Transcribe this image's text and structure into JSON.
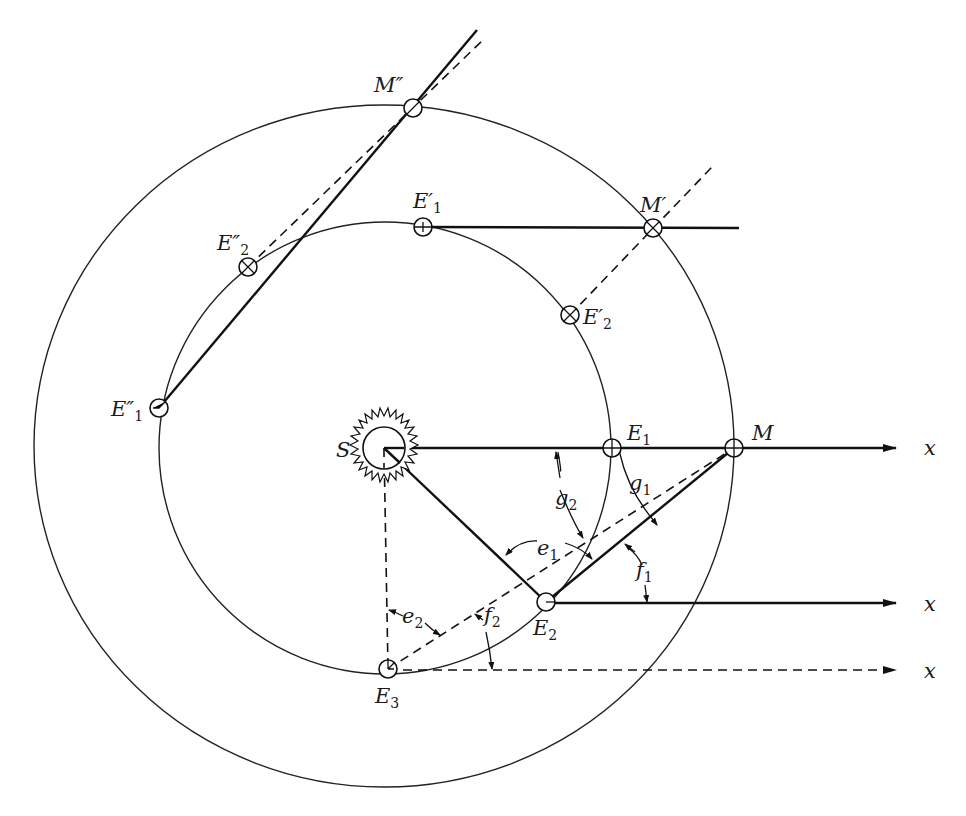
{
  "figure": {
    "colors": {
      "ink": "#111111",
      "background": "#ffffff"
    }
  },
  "labels": {
    "sun": "S",
    "mars": {
      "main": "M",
      "prime": "M′",
      "dprime": "M″"
    },
    "earth": {
      "e1": {
        "main": "E",
        "sub": "1"
      },
      "e2": {
        "main": "E",
        "sub": "2"
      },
      "e3": {
        "main": "E",
        "sub": "3"
      },
      "e1p": {
        "main": "E′",
        "sub": "1"
      },
      "e2p": {
        "main": "E′",
        "sub": "2"
      },
      "e1pp": {
        "main": "E″",
        "sub": "1"
      },
      "e2pp": {
        "main": "E″",
        "sub": "2"
      }
    },
    "angles": {
      "g1": {
        "main": "g",
        "sub": "1"
      },
      "g2": {
        "main": "g",
        "sub": "2"
      },
      "e1": {
        "main": "e",
        "sub": "1"
      },
      "e2": {
        "main": "e",
        "sub": "2"
      },
      "f1": {
        "main": "f",
        "sub": "1"
      },
      "f2": {
        "main": "f",
        "sub": "2"
      }
    },
    "axis": [
      "x",
      "x",
      "x"
    ]
  }
}
